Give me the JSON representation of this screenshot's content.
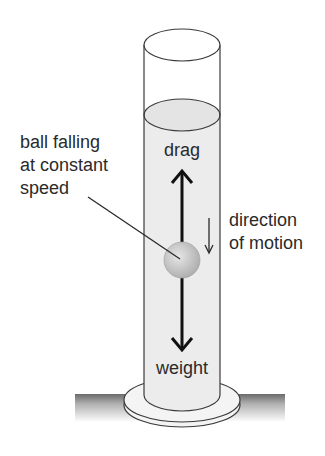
{
  "diagram": {
    "labels": {
      "ball_line1": "ball falling",
      "ball_line2": "at constant",
      "ball_line3": "speed",
      "drag": "drag",
      "weight": "weight",
      "direction_line1": "direction",
      "direction_line2": "of motion"
    },
    "components": [
      "measuring cylinder",
      "liquid",
      "ball",
      "drag arrow",
      "weight arrow",
      "direction of motion arrow",
      "base",
      "ground"
    ],
    "colors": {
      "outline": "#3a3a3a",
      "liquid": "#ececec",
      "ball": "#c8c8c8",
      "text": "#2a2a2a"
    }
  }
}
